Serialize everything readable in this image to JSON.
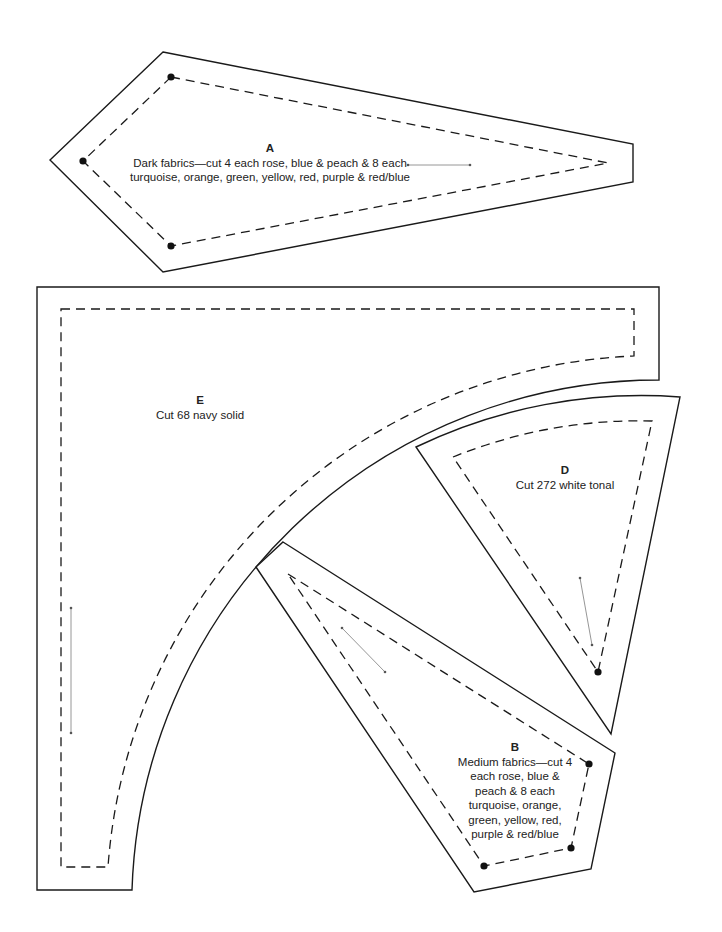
{
  "pieces": {
    "A": {
      "letter": "A",
      "line1": "Dark fabrics—cut 4 each rose, blue & peach & 8 each",
      "line2": "turquoise, orange, green, yellow, red, purple & red/blue"
    },
    "B": {
      "letter": "B",
      "lines": [
        "Medium fabrics—cut 4",
        "each rose, blue &",
        "peach & 8 each",
        "turquoise, orange,",
        "green, yellow, red,",
        "purple & red/blue"
      ]
    },
    "D": {
      "letter": "D",
      "text": "Cut 272 white tonal"
    },
    "E": {
      "letter": "E",
      "text": "Cut 68 navy solid"
    }
  },
  "colors": {
    "line": "#1a1a1a",
    "grainline": "#8a8a8a",
    "background": "#ffffff"
  }
}
